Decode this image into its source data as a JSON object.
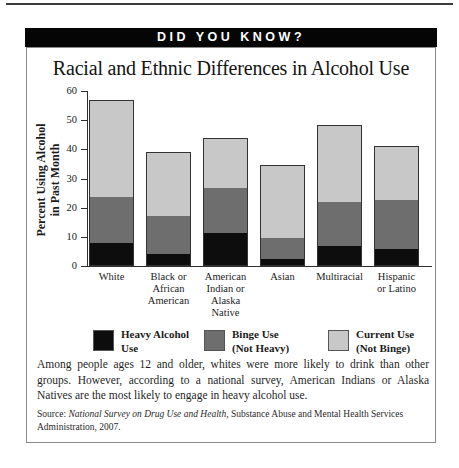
{
  "page": {
    "banner": "DID YOU KNOW?"
  },
  "colors": {
    "banner_bg": "#050505",
    "banner_text": "#ffffff",
    "bar_heavy": "#0d0d0d",
    "bar_binge": "#6e6e6e",
    "bar_current": "#c8c8c8"
  },
  "chart_data": {
    "type": "bar",
    "stacked": true,
    "title": "Racial and Ethnic Differences in Alcohol Use",
    "ylabel": "Percent Using Alcohol\nin Past Month",
    "xlabel": "",
    "ylim": [
      0,
      60
    ],
    "yticks": [
      0,
      10,
      20,
      30,
      40,
      50,
      60
    ],
    "grid": false,
    "legend_position": "bottom",
    "categories": [
      "White",
      "Black or\nAfrican\nAmerican",
      "American\nIndian or\nAlaska\nNative",
      "Asian",
      "Multiracial",
      "Hispanic\nor Latino"
    ],
    "series": [
      {
        "name": "Heavy Alcohol\nUse",
        "color": "#0d0d0d",
        "values": [
          7.5,
          4,
          11,
          2,
          6.5,
          5.5
        ]
      },
      {
        "name": "Binge Use\n(Not Heavy)",
        "color": "#6e6e6e",
        "values": [
          16,
          13,
          16,
          7.5,
          15.5,
          17
        ]
      },
      {
        "name": "Current Use\n(Not Binge)",
        "color": "#c8c8c8",
        "values": [
          33.5,
          22,
          17,
          25,
          26.5,
          18.5
        ]
      }
    ],
    "totals": [
      57,
      39,
      44,
      34.5,
      48.5,
      41
    ]
  },
  "caption": "Among people ages 12 and older, whites were more likely to drink than other groups. However, according to a national survey, American Indians or Alaska Natives are the most likely to engage in heavy alcohol use.",
  "source": {
    "prefix": "Source: ",
    "italic": "National Survey on Drug Use and Health,",
    "rest": " Substance Abuse and Mental Health Services Administration, 2007."
  }
}
